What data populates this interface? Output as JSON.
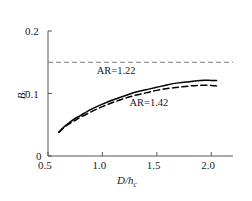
{
  "chart_data": {
    "type": "line",
    "title": "",
    "xlabel": "D/h_c",
    "xlabel_main": "D/h",
    "xlabel_sub": "c",
    "ylabel": "B_i",
    "ylabel_main": "B",
    "ylabel_sub": "i",
    "xlim": [
      0.5,
      2.2
    ],
    "ylim": [
      0.0,
      0.2
    ],
    "xticks": [
      0.5,
      1.0,
      1.5,
      2.0
    ],
    "xticklabels": [
      "0.5",
      "1.0",
      "1.5",
      "2.0"
    ],
    "yticks": [
      0.0,
      0.1,
      0.2
    ],
    "yticklabels": [
      "0",
      "0.1",
      "0.2"
    ],
    "grid": false,
    "legend_position": "inline-annotations",
    "reference_lines": [
      {
        "name": "upper-limit",
        "orientation": "horizontal",
        "value": 0.15,
        "style": "dashed",
        "color": "#7a7a7a"
      }
    ],
    "series": [
      {
        "name": "AR=1.22",
        "label": "AR=1.22",
        "style": "solid",
        "color": "#000000",
        "x": [
          0.6,
          0.65,
          0.7,
          0.75,
          0.8,
          0.9,
          1.0,
          1.1,
          1.2,
          1.3,
          1.4,
          1.5,
          1.6,
          1.7,
          1.8,
          1.9,
          2.0,
          2.05
        ],
        "y": [
          0.038,
          0.047,
          0.054,
          0.06,
          0.065,
          0.075,
          0.083,
          0.09,
          0.096,
          0.102,
          0.106,
          0.11,
          0.114,
          0.117,
          0.119,
          0.121,
          0.121,
          0.121
        ]
      },
      {
        "name": "AR=1.42",
        "label": "AR=1.42",
        "style": "dashed",
        "color": "#000000",
        "x": [
          0.6,
          0.65,
          0.7,
          0.75,
          0.8,
          0.9,
          1.0,
          1.1,
          1.2,
          1.3,
          1.4,
          1.5,
          1.6,
          1.7,
          1.8,
          1.9,
          2.0,
          2.05
        ],
        "y": [
          0.038,
          0.046,
          0.052,
          0.057,
          0.062,
          0.071,
          0.079,
          0.086,
          0.092,
          0.097,
          0.101,
          0.105,
          0.108,
          0.11,
          0.112,
          0.113,
          0.113,
          0.112
        ]
      }
    ],
    "annotations": [
      {
        "name": "ar-122-annotation",
        "text": "AR=1.22",
        "x": 1.15,
        "y": 0.135
      },
      {
        "name": "ar-142-annotation",
        "text": "AR=1.42",
        "x": 1.45,
        "y": 0.083
      }
    ]
  },
  "axes": {
    "x_tick_0": "0.5",
    "x_tick_1": "1.0",
    "x_tick_2": "1.5",
    "x_tick_3": "2.0",
    "y_tick_0": "0",
    "y_tick_1": "0.1",
    "y_tick_2": "0.2",
    "x_title_main": "D/h",
    "x_title_sub": "c",
    "y_title_main": "B",
    "y_title_sub": "i"
  },
  "labels": {
    "series_1": "AR=1.22",
    "series_2": "AR=1.42"
  }
}
